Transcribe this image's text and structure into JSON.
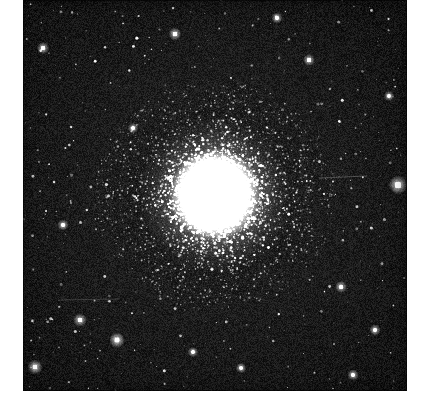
{
  "figure": {
    "kind": "astronomical-photograph",
    "caption": "",
    "plate": {
      "left": 23,
      "top": 0,
      "width": 384,
      "height": 391,
      "background_color": "#1b1b1b",
      "grain": true
    },
    "page": {
      "width": 432,
      "height": 409,
      "paper_color": "#ffffff"
    }
  },
  "chart_data": {
    "type": "scatter",
    "title": "",
    "subtitle": "",
    "xlabel": "",
    "ylabel": "",
    "grid": false,
    "legend_position": "none",
    "xlim": [
      0,
      384
    ],
    "ylim": [
      0,
      391
    ],
    "annotations": [],
    "cluster": {
      "center_x": 192,
      "center_y": 195,
      "core_radius": 30,
      "core_color": "#ffffff",
      "halo_radius": 118,
      "halo_falloff": 1.75,
      "halo_star_count": 5200,
      "halo_star_min_size": 0.7,
      "halo_star_max_size": 2.6
    },
    "glow": {
      "inner_radius": 10,
      "outer_radius": 78,
      "peak_alpha": 1.0
    },
    "field_stars": {
      "count": 620,
      "min_size": 0.7,
      "max_size": 3.2,
      "color": "#f2f2f2"
    },
    "bright_field_stars": [
      {
        "x": 375,
        "y": 185,
        "size": 5.0,
        "brightness": 1.0
      },
      {
        "x": 152,
        "y": 34,
        "size": 3.4,
        "brightness": 0.95
      },
      {
        "x": 20,
        "y": 48,
        "size": 3.2,
        "brightness": 0.92
      },
      {
        "x": 94,
        "y": 340,
        "size": 4.2,
        "brightness": 1.0
      },
      {
        "x": 12,
        "y": 367,
        "size": 4.0,
        "brightness": 1.0
      },
      {
        "x": 57,
        "y": 320,
        "size": 3.6,
        "brightness": 0.95
      },
      {
        "x": 318,
        "y": 287,
        "size": 3.2,
        "brightness": 0.9
      },
      {
        "x": 352,
        "y": 330,
        "size": 3.0,
        "brightness": 0.9
      },
      {
        "x": 254,
        "y": 18,
        "size": 3.0,
        "brightness": 0.9
      },
      {
        "x": 286,
        "y": 60,
        "size": 3.2,
        "brightness": 0.92
      },
      {
        "x": 330,
        "y": 375,
        "size": 3.0,
        "brightness": 0.9
      },
      {
        "x": 40,
        "y": 225,
        "size": 3.0,
        "brightness": 0.9
      },
      {
        "x": 170,
        "y": 352,
        "size": 2.8,
        "brightness": 0.88
      },
      {
        "x": 218,
        "y": 368,
        "size": 2.8,
        "brightness": 0.88
      },
      {
        "x": 366,
        "y": 96,
        "size": 2.8,
        "brightness": 0.88
      },
      {
        "x": 110,
        "y": 128,
        "size": 2.8,
        "brightness": 0.88
      }
    ],
    "background": {
      "base_color": "#1d1d1d",
      "vignette_color": "#0f0f0f",
      "noise_amplitude": 17
    },
    "scratches": [
      {
        "x1": 296,
        "y1": 178,
        "x2": 344,
        "y2": 176,
        "alpha": 0.35
      },
      {
        "x1": 36,
        "y1": 300,
        "x2": 96,
        "y2": 299,
        "alpha": 0.22
      }
    ]
  }
}
